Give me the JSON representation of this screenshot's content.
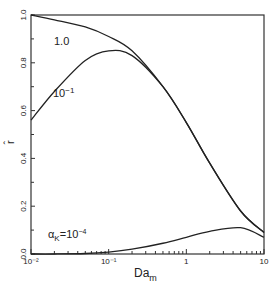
{
  "chart_data": {
    "type": "line",
    "title": "",
    "xlabel": "Da_m",
    "xlabel_main": "Da",
    "xlabel_sub": "m",
    "ylabel": "r̂",
    "xscale": "log",
    "xlim": [
      0.01,
      10
    ],
    "ylim": [
      0.0,
      1.0
    ],
    "grid": false,
    "legend": "inline curve labels",
    "x_ticks": [
      {
        "value": 0.01,
        "label": "10⁻²"
      },
      {
        "value": 0.1,
        "label": "10⁻¹"
      },
      {
        "value": 1,
        "label": "1"
      },
      {
        "value": 10,
        "label": "10"
      }
    ],
    "y_ticks": [
      {
        "value": 0.0,
        "label": "0.0"
      },
      {
        "value": 0.2,
        "label": "0.2"
      },
      {
        "value": 0.4,
        "label": "0.4"
      },
      {
        "value": 0.6,
        "label": "0.6"
      },
      {
        "value": 0.8,
        "label": "0.8"
      },
      {
        "value": 1.0,
        "label": "1.0"
      }
    ],
    "x": [
      0.01,
      0.02,
      0.05,
      0.1,
      0.2,
      0.5,
      1,
      2,
      5,
      10
    ],
    "series": [
      {
        "name": "1.0",
        "label": "1.0",
        "values": [
          1.0,
          0.98,
          0.95,
          0.91,
          0.85,
          0.7,
          0.55,
          0.38,
          0.18,
          0.09
        ]
      },
      {
        "name": "10⁻¹",
        "label": "10⁻¹",
        "values": [
          0.56,
          0.68,
          0.81,
          0.85,
          0.83,
          0.7,
          0.55,
          0.38,
          0.18,
          0.09
        ]
      },
      {
        "name": "10⁻⁴",
        "label": "a_K = 10⁻⁴",
        "values": [
          0.0,
          0.0,
          0.002,
          0.008,
          0.02,
          0.045,
          0.07,
          0.095,
          0.11,
          0.07
        ]
      }
    ],
    "annotations": [
      {
        "text": "1.0",
        "near_series": "1.0"
      },
      {
        "text": "10⁻¹",
        "near_series": "10⁻¹"
      },
      {
        "text": "a_K = 10⁻⁴",
        "near_series": "10⁻⁴"
      }
    ]
  },
  "labels": {
    "curve_1": "1.0",
    "curve_2_base": "10",
    "curve_2_exp": "−1",
    "curve_3_prefix": "α",
    "curve_3_sub": "K",
    "curve_3_eq": "=10",
    "curve_3_exp": "−4",
    "xlabel_main": "Da",
    "xlabel_sub": "m",
    "ylabel": "r̂"
  }
}
